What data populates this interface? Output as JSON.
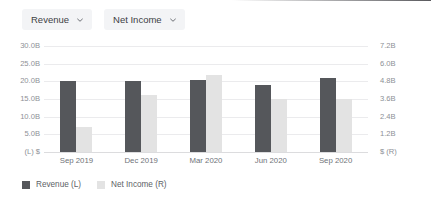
{
  "toolbar": {
    "dropdowns": [
      {
        "label": "Revenue",
        "icon": "chevron-down-icon"
      },
      {
        "label": "Net Income",
        "icon": "chevron-down-icon"
      }
    ]
  },
  "colors": {
    "revenue_bar": "#55575b",
    "net_income_bar": "#e3e3e3",
    "gridline": "#ebebed",
    "axis_text": "#8d9096",
    "label_text": "#6f7378",
    "dropdown_bg": "#f3f4f6"
  },
  "chart_data": {
    "type": "bar",
    "title": "",
    "xlabel": "",
    "categories": [
      "Sep 2019",
      "Dec 2019",
      "Mar 2020",
      "Jun 2020",
      "Sep 2020"
    ],
    "series": [
      {
        "name": "Revenue (L)",
        "axis": "left",
        "color": "#55575b",
        "values": [
          20.0,
          20.0,
          20.5,
          19.0,
          21.0
        ]
      },
      {
        "name": "Net Income (R)",
        "axis": "right",
        "color": "#e3e3e3",
        "values": [
          1.7,
          3.9,
          5.2,
          3.6,
          3.6
        ]
      }
    ],
    "left_axis": {
      "label": "(L) $",
      "ticks": [
        "30.0B",
        "25.0B",
        "20.0B",
        "15.0B",
        "10.0B",
        "5.0B"
      ],
      "tick_values": [
        30.0,
        25.0,
        20.0,
        15.0,
        10.0,
        5.0
      ],
      "ylim": [
        0,
        30
      ],
      "unit": "B"
    },
    "right_axis": {
      "label": "$ (R)",
      "ticks": [
        "7.2B",
        "6.0B",
        "4.8B",
        "3.6B",
        "2.4B",
        "1.2B"
      ],
      "tick_values": [
        7.2,
        6.0,
        4.8,
        3.6,
        2.4,
        1.2
      ],
      "ylim": [
        0,
        7.2
      ],
      "unit": "B"
    },
    "grid": true,
    "legend_position": "bottom-left",
    "legend": [
      "Revenue (L)",
      "Net Income (R)"
    ]
  }
}
